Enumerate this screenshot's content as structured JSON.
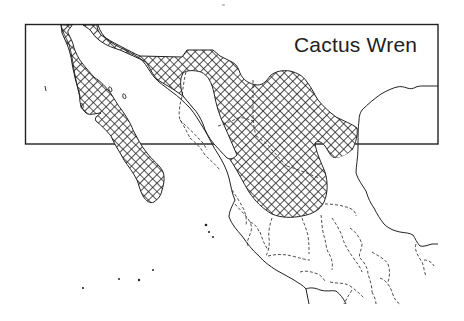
{
  "map": {
    "title": "Cactus Wren",
    "region": "Mexico and southwestern United States",
    "legend": [
      {
        "pattern": "crosshatch",
        "meaning": "range"
      }
    ],
    "colors": {
      "ink": "#222222",
      "background": "#ffffff"
    },
    "layers": [
      "coastline",
      "state-borders-dashed",
      "range-crosshatch",
      "islands"
    ]
  }
}
